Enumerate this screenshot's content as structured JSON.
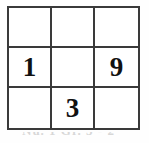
{
  "figure": {
    "rows": 3,
    "columns": 3,
    "border_color": "#3a3a3a",
    "cell_background": "#ffffff",
    "digit_color": "#111111"
  },
  "grid": {
    "cells": [
      {
        "row": 0,
        "col": 0,
        "value": ""
      },
      {
        "row": 0,
        "col": 1,
        "value": ""
      },
      {
        "row": 0,
        "col": 2,
        "value": ""
      },
      {
        "row": 1,
        "col": 0,
        "value": "1"
      },
      {
        "row": 1,
        "col": 1,
        "value": ""
      },
      {
        "row": 1,
        "col": 2,
        "value": "9"
      },
      {
        "row": 2,
        "col": 0,
        "value": ""
      },
      {
        "row": 2,
        "col": 1,
        "value": "3"
      },
      {
        "row": 2,
        "col": 2,
        "value": ""
      }
    ]
  },
  "caption": {
    "text": "Nu. 1 Gr. 3 - 2",
    "note": "cut off at bottom edge, illegible"
  }
}
